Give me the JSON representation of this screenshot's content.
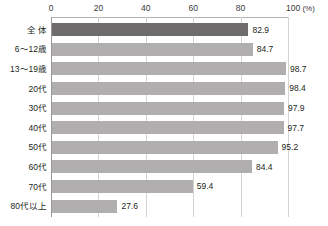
{
  "chart_data": {
    "type": "bar",
    "orientation": "horizontal",
    "title": "",
    "xlabel": "(%)",
    "ylabel": "",
    "xlim": [
      0,
      100
    ],
    "xticks": [
      0,
      20,
      40,
      60,
      80,
      100
    ],
    "xtick_labels": [
      "0",
      "20",
      "40",
      "60",
      "80",
      "100"
    ],
    "unit_label": "(%)",
    "grid": true,
    "legend": "none",
    "categories": [
      "全 体",
      "6〜12歳",
      "13〜19歳",
      "20代",
      "30代",
      "40代",
      "50代",
      "60代",
      "70代",
      "80代以上"
    ],
    "values": [
      82.9,
      84.7,
      98.7,
      98.4,
      97.9,
      97.7,
      95.2,
      84.4,
      59.4,
      27.6
    ],
    "value_labels": [
      "82.9",
      "84.7",
      "98.7",
      "98.4",
      "97.9",
      "97.7",
      "95.2",
      "84.4",
      "59.4",
      "27.6"
    ],
    "highlight_index": 0,
    "colors": {
      "bar": "#b0aeae",
      "bar_highlight": "#6e6c6c",
      "grid": "#d6d4d2",
      "axis": "#9b9896",
      "text": "#231f20",
      "background": "#ffffff"
    }
  }
}
